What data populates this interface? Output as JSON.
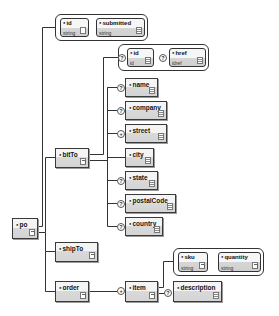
{
  "diagram": {
    "type": "xml-schema-tree",
    "root": {
      "name": "po",
      "attributes": [
        {
          "name": "id",
          "type": "string"
        },
        {
          "name": "submitted",
          "type": "string"
        }
      ],
      "children": [
        {
          "name": "bitTo",
          "attributes": [
            {
              "name": "id",
              "type": "id",
              "optional_marker": "?"
            },
            {
              "name": "href",
              "type": "idref",
              "optional_marker": "?"
            }
          ],
          "children": [
            {
              "name": "name",
              "marker": "?"
            },
            {
              "name": "company",
              "marker": "?"
            },
            {
              "name": "street",
              "marker": "+"
            },
            {
              "name": "city",
              "marker": ""
            },
            {
              "name": "state",
              "marker": "?"
            },
            {
              "name": "postalCode",
              "marker": "?"
            },
            {
              "name": "country",
              "marker": "?"
            }
          ]
        },
        {
          "name": "shipTo"
        },
        {
          "name": "order",
          "children": [
            {
              "name": "item",
              "marker": "+",
              "attributes": [
                {
                  "name": "sku",
                  "type": "string"
                },
                {
                  "name": "quantity",
                  "type": "string"
                }
              ],
              "children": [
                {
                  "name": "description",
                  "marker": "?"
                }
              ]
            }
          ]
        }
      ]
    }
  },
  "labels": {
    "po": "po",
    "po_attr_id": "id",
    "po_attr_id_type": "string",
    "po_attr_submitted": "submitted",
    "po_attr_submitted_type": "string",
    "billto": "bitTo",
    "billto_attr_id": "id",
    "billto_attr_id_type": "id",
    "billto_attr_href": "href",
    "billto_attr_href_type": "idref",
    "name": "name",
    "company": "company",
    "street": "street",
    "city": "city",
    "state": "state",
    "postalcode": "postalCode",
    "country": "country",
    "shipto": "shipTo",
    "order": "order",
    "item": "item",
    "item_attr_sku": "sku",
    "item_attr_sku_type": "string",
    "item_attr_quantity": "quantity",
    "item_attr_quantity_type": "string",
    "description": "description"
  },
  "markers": {
    "optional": "?",
    "one_or_more": "+"
  },
  "colors": {
    "stroke": "#333333",
    "node_top": "#f4f4f4",
    "node_bottom": "#d4d4d4",
    "background": "#ffffff"
  }
}
